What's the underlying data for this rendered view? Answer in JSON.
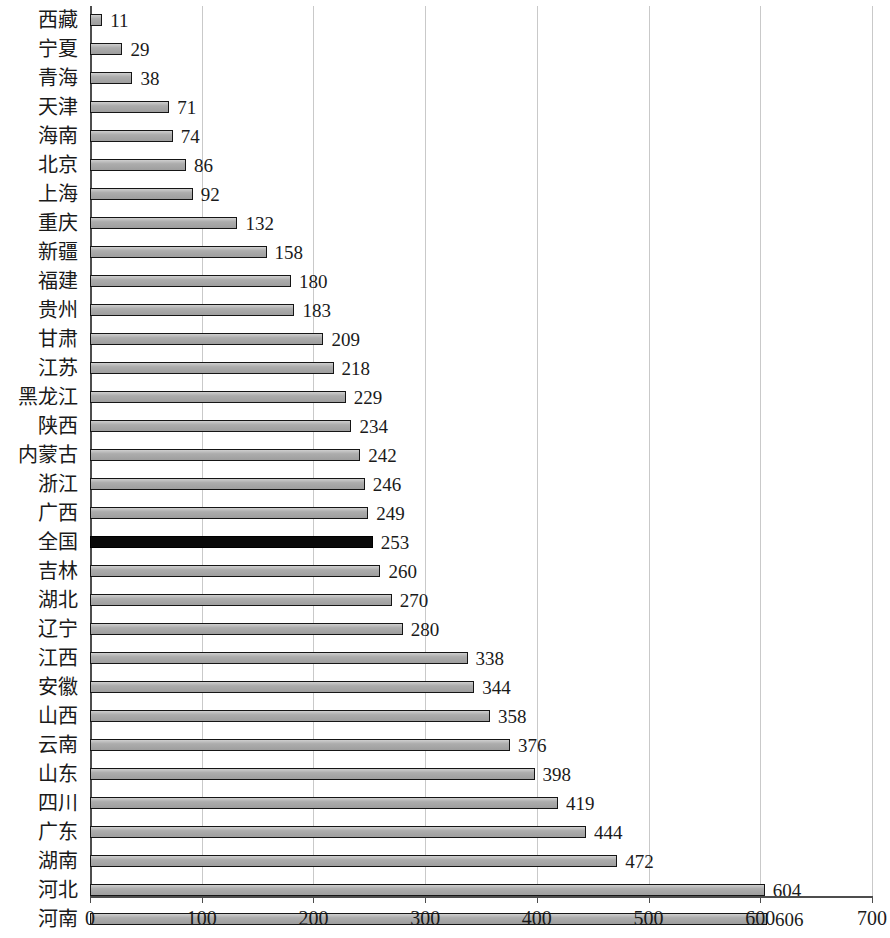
{
  "chart_data": {
    "type": "bar",
    "orientation": "horizontal",
    "title": "",
    "subtitle": "",
    "xlabel": "",
    "ylabel": "",
    "xlim": [
      0,
      700
    ],
    "xticks": [
      0,
      100,
      200,
      300,
      400,
      500,
      600,
      700
    ],
    "xtick_labels": [
      "0",
      "100",
      "200",
      "300",
      "400",
      "500",
      "600",
      "700"
    ],
    "grid": "vertical",
    "legend": "none",
    "categories": [
      "西藏",
      "宁夏",
      "青海",
      "天津",
      "海南",
      "北京",
      "上海",
      "重庆",
      "新疆",
      "福建",
      "贵州",
      "甘肃",
      "江苏",
      "黑龙江",
      "陕西",
      "内蒙古",
      "浙江",
      "广西",
      "全国",
      "吉林",
      "湖北",
      "辽宁",
      "江西",
      "安徽",
      "山西",
      "云南",
      "山东",
      "四川",
      "广东",
      "湖南",
      "河北",
      "河南"
    ],
    "values": [
      11,
      29,
      38,
      71,
      74,
      86,
      92,
      132,
      158,
      180,
      183,
      209,
      218,
      229,
      234,
      242,
      246,
      249,
      253,
      260,
      270,
      280,
      338,
      344,
      358,
      376,
      398,
      419,
      444,
      472,
      604,
      606
    ],
    "value_labels": [
      "11",
      "29",
      "38",
      "71",
      "74",
      "86",
      "92",
      "132",
      "158",
      "180",
      "183",
      "209",
      "218",
      "229",
      "234",
      "242",
      "246",
      "249",
      "253",
      "260",
      "270",
      "280",
      "338",
      "344",
      "358",
      "376",
      "398",
      "419",
      "444",
      "472",
      "604",
      "606"
    ],
    "highlight_category": "全国",
    "highlight_index": 18,
    "colors": {
      "bar_fill": "#a8a8a8",
      "bar_edge": "#151515",
      "highlight_fill": "#0a0a0a",
      "gridline": "#c9c9c9",
      "axis": "#4d4d4d",
      "text": "#1a1a1a",
      "background": "#ffffff"
    }
  }
}
